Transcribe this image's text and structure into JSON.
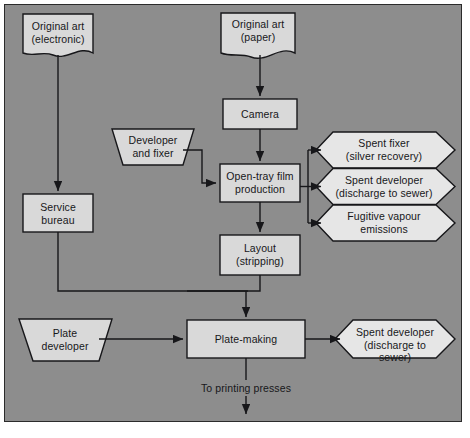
{
  "diagram": {
    "colors": {
      "background": "#8d8d8d",
      "shape_fill": "#d9d9d9",
      "shape_stroke": "#17171a",
      "line": "#17171a",
      "frame_border": "#2b2b2b"
    },
    "nodes": [
      {
        "id": "original-art-electronic",
        "label": "Original art\n(electronic)",
        "shape": "document"
      },
      {
        "id": "original-art-paper",
        "label": "Original art\n(paper)",
        "shape": "document"
      },
      {
        "id": "camera",
        "label": "Camera",
        "shape": "process"
      },
      {
        "id": "developer-and-fixer",
        "label": "Developer\nand fixer",
        "shape": "inverted-trapezoid"
      },
      {
        "id": "open-tray-film-production",
        "label": "Open-tray film\nproduction",
        "shape": "process"
      },
      {
        "id": "service-bureau",
        "label": "Service\nbureau",
        "shape": "process"
      },
      {
        "id": "layout-stripping",
        "label": "Layout\n(stripping)",
        "shape": "process"
      },
      {
        "id": "spent-fixer",
        "label": "Spent fixer\n(silver recovery)",
        "shape": "hexagon"
      },
      {
        "id": "spent-developer-film",
        "label": "Spent developer\n(discharge to sewer)",
        "shape": "hexagon"
      },
      {
        "id": "fugitive-vapour-emissions",
        "label": "Fugitive vapour\nemissions",
        "shape": "hexagon"
      },
      {
        "id": "plate-developer",
        "label": "Plate\ndeveloper",
        "shape": "inverted-trapezoid"
      },
      {
        "id": "plate-making",
        "label": "Plate-making",
        "shape": "process"
      },
      {
        "id": "spent-developer-plate",
        "label": "Spent developer\n(discharge to sewer)",
        "shape": "hexagon"
      }
    ],
    "flow_labels": [
      {
        "id": "to-printing-presses",
        "label": "To printing presses"
      }
    ]
  }
}
